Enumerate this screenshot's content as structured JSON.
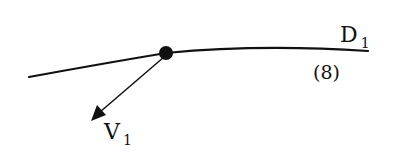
{
  "diagram": {
    "curve": {
      "name": "D",
      "subscript": "1",
      "equation_label": "(8)",
      "color": "#111111"
    },
    "point": {
      "color": "#111111"
    },
    "vector": {
      "name": "V",
      "subscript": "1",
      "color": "#111111"
    }
  }
}
